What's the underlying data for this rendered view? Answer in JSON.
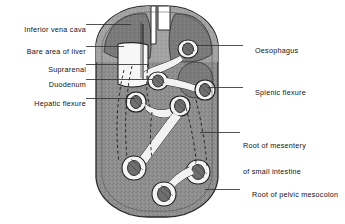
{
  "figure": {
    "colors": {
      "background": "#ffffff",
      "body_fill": "#8c8c8c",
      "body_fill_light": "#a6a6a6",
      "outline": "#2b2b2b",
      "structure_fill": "#f2f2f2",
      "structure_outline": "#222222",
      "leader_line": "#333333",
      "text": "#111111"
    }
  },
  "labels_left": [
    {
      "id": "inferior-vena-cava",
      "text": "Inferior vena cava",
      "text_x": 8,
      "text_y": 17,
      "leader": "M 86,24.5 L 131,24.5"
    },
    {
      "id": "bare-area-of-liver",
      "text": "Bare area of liver",
      "text_x": 14,
      "text_y": 39,
      "leader": "M 86,46.5 L 124,46.5"
    },
    {
      "id": "suprarenal",
      "text": "Suprarenal",
      "text_x": 41,
      "text_y": 57,
      "leader": "M 86,64.5 L 147,64.5"
    },
    {
      "id": "duodenum",
      "text": "Duodenum",
      "text_x": 41,
      "text_y": 72,
      "leader": "M 86,79.5 L 152,79.5"
    },
    {
      "id": "hepatic-flexure",
      "text": "Hepatic flexure",
      "text_x": 20,
      "text_y": 91,
      "leader": "M 86,98.5 L 135,98.5"
    }
  ],
  "labels_right": [
    {
      "id": "oesophagus",
      "text": "Oesophagus",
      "text_x": 246,
      "text_y": 38,
      "leader": "M 196,45.5 L 243,45.5"
    },
    {
      "id": "splenic-flexure",
      "text": "Splenic flexure",
      "text_x": 246,
      "text_y": 80,
      "leader": "M 208,87.5 L 243,87.5"
    },
    {
      "id": "root-of-mesentery",
      "line1": "Root of mesentery",
      "line2": "of small intestine",
      "text_x": 243,
      "text_y": 125,
      "leader": "M 200,132.5 L 240,132.5"
    },
    {
      "id": "root-of-pelvic-mesocolon",
      "text": "Root of pelvic mesocolon",
      "text_x": 243,
      "text_y": 182,
      "leader": "M 205,189.5 L 240,189.5"
    }
  ]
}
